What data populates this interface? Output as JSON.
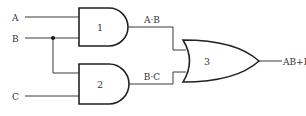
{
  "diagram": {
    "type": "logic-circuit",
    "colors": {
      "wire": "#3a3a3a",
      "gate_stroke": "#222222",
      "text": "#333333",
      "background": "#ffffff"
    },
    "inputs": [
      {
        "id": "A",
        "label": "A"
      },
      {
        "id": "B",
        "label": "B"
      },
      {
        "id": "C",
        "label": "C"
      }
    ],
    "gates": [
      {
        "id": "1",
        "type": "AND",
        "label": "1",
        "inputs": [
          "A",
          "B"
        ],
        "output_label": "A·B"
      },
      {
        "id": "2",
        "type": "AND",
        "label": "2",
        "inputs": [
          "B",
          "C"
        ],
        "output_label": "B·C"
      },
      {
        "id": "3",
        "type": "OR",
        "label": "3",
        "inputs": [
          "A·B",
          "B·C"
        ],
        "output_label": "AB+BC=Y"
      }
    ],
    "junctions": [
      {
        "on_wire": "B",
        "description": "B branches to gate 2"
      }
    ]
  }
}
